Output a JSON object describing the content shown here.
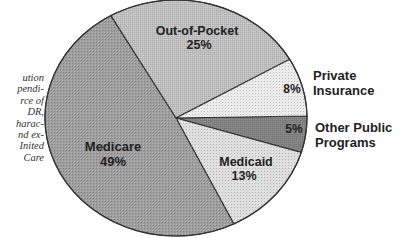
{
  "caption": {
    "lines": [
      "ution",
      "pendi-",
      "rce of",
      "DR,",
      "harac-",
      "nd ex-",
      "Inited",
      "Care"
    ]
  },
  "chart_data": {
    "type": "pie",
    "title": "",
    "start_angle_deg": -1,
    "direction": "clockwise",
    "slices": [
      {
        "name": "Other Public Programs",
        "label_line1": "Other Public",
        "label_line2": "Programs",
        "value": 5,
        "pct_label": "5%",
        "color": "#8c8c8c"
      },
      {
        "name": "Medicaid",
        "label_line1": "Medicaid",
        "label_line2": "",
        "value": 13,
        "pct_label": "13%",
        "color": "#dedede"
      },
      {
        "name": "Medicare",
        "label_line1": "Medicare",
        "label_line2": "",
        "value": 49,
        "pct_label": "49%",
        "color": "#9e9e9e"
      },
      {
        "name": "Out-of-Pocket",
        "label_line1": "Out-of-Pocket",
        "label_line2": "",
        "value": 25,
        "pct_label": "25%",
        "color": "#cdcdcd"
      },
      {
        "name": "Private Insurance",
        "label_line1": "Private",
        "label_line2": "Insurance",
        "value": 8,
        "pct_label": "8%",
        "color": "#ebebeb"
      }
    ],
    "categories": [
      "Other Public Programs",
      "Medicaid",
      "Medicare",
      "Out-of-Pocket",
      "Private Insurance"
    ],
    "values": [
      5,
      13,
      49,
      25,
      8
    ],
    "legend": "none (labels placed on/next to slices)"
  },
  "labels": {
    "medicare": {
      "name": "Medicare",
      "pct": "49%"
    },
    "out_of_pocket": {
      "name": "Out-of-Pocket",
      "pct": "25%"
    },
    "private": {
      "line1": "Private",
      "line2": "Insurance",
      "pct": "8%"
    },
    "other": {
      "line1": "Other Public",
      "line2": "Programs",
      "pct": "5%"
    },
    "medicaid": {
      "name": "Medicaid",
      "pct": "13%"
    }
  }
}
